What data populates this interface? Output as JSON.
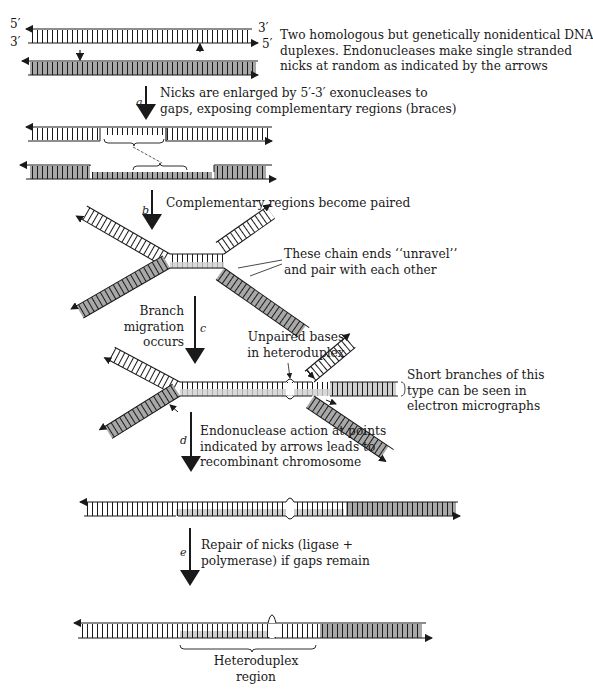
{
  "figure": {
    "colors": {
      "strand_line": "#1a1a1a",
      "shaded_duplex": "#a8a8a8",
      "light_shade": "#cfcfcf",
      "background": "#ffffff"
    },
    "end_labels": {
      "top_left_5": "5′",
      "bottom_left_3": "3′",
      "top_right_3": "3′",
      "bottom_right_5": "5′"
    },
    "stages": [
      {
        "id": "initial",
        "caption": "Two homologous but genetically nonidentical DNA\nduplexes. Endonucleases make single stranded\nnicks at random as indicated by the arrows"
      },
      {
        "id": "a",
        "step_letter": "a",
        "caption": "Nicks are enlarged by 5′-3′ exonucleases to\ngaps, exposing complementary regions (braces)"
      },
      {
        "id": "b",
        "step_letter": "b",
        "caption": "Complementary regions become paired",
        "annotation": "These chain ends ‘‘unravel’’\nand pair with each other"
      },
      {
        "id": "c",
        "step_letter": "c",
        "caption": "Branch\nmigration\noccurs",
        "annotation_unpaired": "Unpaired bases\nin heteroduplex",
        "annotation_branches": "Short branches of this\ntype can be seen in\nelectron micrographs"
      },
      {
        "id": "d",
        "step_letter": "d",
        "caption": "Endonuclease action at points\nindicated by arrows leads to\nrecombinant chromosome"
      },
      {
        "id": "e",
        "step_letter": "e",
        "caption": "Repair of nicks (ligase +\npolymerase) if gaps remain",
        "region_label": "Heteroduplex\nregion"
      }
    ]
  }
}
